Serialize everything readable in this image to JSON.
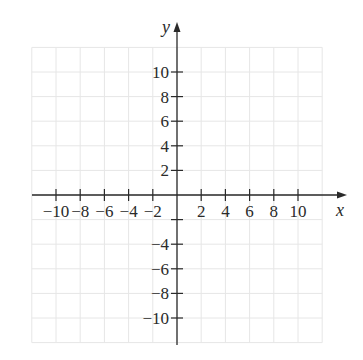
{
  "diagram": {
    "type": "coordinate-plane",
    "x_axis_label": "x",
    "y_axis_label": "y",
    "x_range": [
      -12,
      12
    ],
    "y_range": [
      -12,
      12
    ],
    "grid_step": 2,
    "x_ticks": [
      -10,
      -8,
      -6,
      -4,
      -2,
      2,
      4,
      6,
      8,
      10
    ],
    "y_ticks": [
      10,
      8,
      6,
      4,
      2,
      -4,
      -6,
      -8,
      -10
    ],
    "x_tick_labels": [
      "−10",
      "−8",
      "−6",
      "−4",
      "−2",
      "2",
      "4",
      "6",
      "8",
      "10"
    ],
    "y_tick_labels": [
      "10",
      "8",
      "6",
      "4",
      "2",
      "−4",
      "−6",
      "−8",
      "−10"
    ],
    "colors": {
      "axis": "#2a2a2a",
      "grid": "#e6e6e6",
      "text": "#2a2a2a"
    }
  }
}
